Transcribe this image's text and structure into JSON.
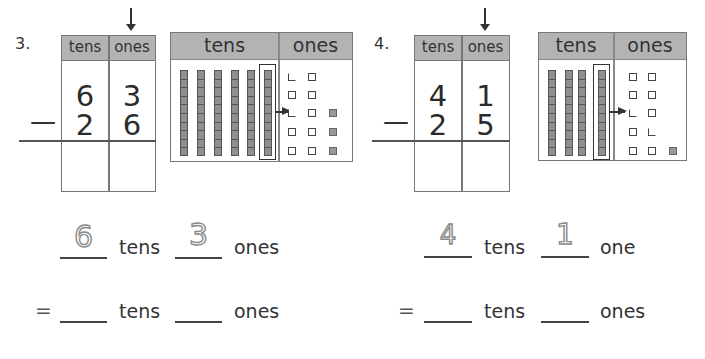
{
  "problems": [
    {
      "number": "3.",
      "grid": {
        "headers": [
          "tens",
          "ones"
        ],
        "top": {
          "tens": "6",
          "ones": "3"
        },
        "bottom": {
          "tens": "2",
          "ones": "6"
        },
        "operator": "—"
      },
      "place_value_chart": {
        "headers": [
          "tens",
          "ones"
        ],
        "tens_rods": 6,
        "regrouped_rod_index": 5,
        "ones_unshaded_from_regroup": 10,
        "ones_shaded": 3
      },
      "equation_line1": {
        "tens_value": "6",
        "tens_label": "tens",
        "ones_value": "3",
        "ones_label": "ones"
      },
      "equation_line2": {
        "equals": "=",
        "tens_label": "tens",
        "ones_label": "ones"
      }
    },
    {
      "number": "4.",
      "grid": {
        "headers": [
          "tens",
          "ones"
        ],
        "top": {
          "tens": "4",
          "ones": "1"
        },
        "bottom": {
          "tens": "2",
          "ones": "5"
        },
        "operator": "—"
      },
      "place_value_chart": {
        "headers": [
          "tens",
          "ones"
        ],
        "tens_rods": 4,
        "regrouped_rod_index": 3,
        "ones_unshaded_from_regroup": 10,
        "ones_shaded": 1
      },
      "equation_line1": {
        "tens_value": "4",
        "tens_label": "tens",
        "ones_value": "1",
        "ones_label": "one"
      },
      "equation_line2": {
        "equals": "=",
        "tens_label": "tens",
        "ones_label": "ones"
      }
    }
  ],
  "colors": {
    "header_grey": "#b3b3b3",
    "cube_shaded": "#999999",
    "line": "#777777",
    "trace": "#8a8a8a"
  }
}
